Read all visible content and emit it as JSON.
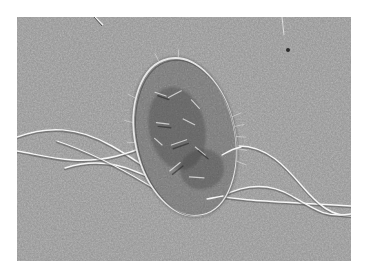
{
  "image": {
    "subject": "electron micrograph of a flagellated bacterium",
    "style": "grayscale",
    "colors": {
      "background": "#ffffff",
      "field": "#9a9a9a",
      "cell_body": "#7c7c7c",
      "cell_dark": "#4a4a4a",
      "highlight": "#f4f4f4"
    }
  }
}
